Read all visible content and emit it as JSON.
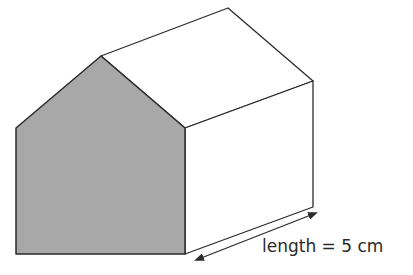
{
  "diagram": {
    "type": "prism",
    "colors": {
      "stroke": "#2b2b2b",
      "shaded_face": "#a8a8a8",
      "faces": "#ffffff",
      "background": "#ffffff"
    },
    "front_face": {
      "shaded": true,
      "vertices": [
        [
          16,
          128
        ],
        [
          101,
          56
        ],
        [
          185,
          128
        ],
        [
          185,
          254
        ],
        [
          16,
          254
        ]
      ]
    },
    "back_offset": [
      128,
      -47
    ],
    "dimension": {
      "label": "length = 5 cm",
      "arrow": {
        "from": [
          194,
          261
        ],
        "to": [
          317,
          213
        ],
        "double_headed": true
      }
    }
  }
}
